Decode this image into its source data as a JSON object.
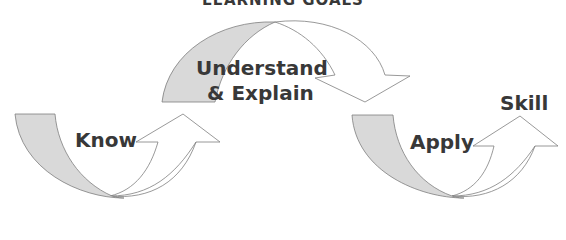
{
  "title": "LEARNING GOALS",
  "colors": {
    "band_fill": "#d9d9d9",
    "arrow_fill": "#ffffff",
    "outline": "#7f7f7f",
    "text": "#383838"
  },
  "stages": [
    {
      "id": "know",
      "label": "Know"
    },
    {
      "id": "understand",
      "label_line1": "Understand",
      "label_line2": "& Explain"
    },
    {
      "id": "apply",
      "label": "Apply"
    }
  ],
  "outcome": {
    "label": "Skill"
  }
}
